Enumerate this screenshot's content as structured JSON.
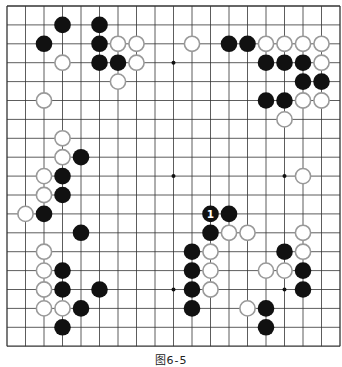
{
  "figure": {
    "caption": "图6-5",
    "board_size": 19,
    "grid": {
      "x0": 7,
      "y0": 6,
      "dx": 18.5,
      "dy": 18.9
    },
    "colors": {
      "line": "#333333",
      "black": "#111111",
      "white_fill": "#ffffff",
      "white_stroke": "#999999",
      "background": "#ffffff"
    },
    "hoshi_visible": [
      [
        9,
        3
      ],
      [
        9,
        9
      ],
      [
        15,
        9
      ],
      [
        9,
        15
      ],
      [
        15,
        15
      ]
    ],
    "black_stones": [
      [
        3,
        1
      ],
      [
        5,
        1
      ],
      [
        2,
        2
      ],
      [
        5,
        2
      ],
      [
        5,
        3
      ],
      [
        6,
        3
      ],
      [
        12,
        2
      ],
      [
        13,
        2
      ],
      [
        14,
        3
      ],
      [
        15,
        3
      ],
      [
        16,
        3
      ],
      [
        16,
        4
      ],
      [
        17,
        4
      ],
      [
        14,
        5
      ],
      [
        15,
        5
      ],
      [
        4,
        8
      ],
      [
        3,
        9
      ],
      [
        3,
        10
      ],
      [
        2,
        11
      ],
      [
        4,
        12
      ],
      [
        3,
        14
      ],
      [
        3,
        15
      ],
      [
        5,
        15
      ],
      [
        4,
        16
      ],
      [
        3,
        17
      ],
      [
        11,
        11
      ],
      [
        12,
        11
      ],
      [
        11,
        12
      ],
      [
        10,
        13
      ],
      [
        10,
        14
      ],
      [
        10,
        15
      ],
      [
        10,
        16
      ],
      [
        15,
        13
      ],
      [
        16,
        14
      ],
      [
        16,
        15
      ],
      [
        14,
        16
      ],
      [
        14,
        17
      ]
    ],
    "white_stones": [
      [
        6,
        2
      ],
      [
        7,
        2
      ],
      [
        3,
        3
      ],
      [
        7,
        3
      ],
      [
        6,
        4
      ],
      [
        2,
        5
      ],
      [
        10,
        2
      ],
      [
        14,
        2
      ],
      [
        15,
        2
      ],
      [
        16,
        2
      ],
      [
        17,
        2
      ],
      [
        17,
        3
      ],
      [
        16,
        5
      ],
      [
        17,
        5
      ],
      [
        15,
        6
      ],
      [
        3,
        7
      ],
      [
        3,
        8
      ],
      [
        2,
        9
      ],
      [
        2,
        10
      ],
      [
        1,
        11
      ],
      [
        2,
        13
      ],
      [
        2,
        14
      ],
      [
        2,
        15
      ],
      [
        2,
        16
      ],
      [
        3,
        16
      ],
      [
        12,
        12
      ],
      [
        13,
        12
      ],
      [
        11,
        13
      ],
      [
        11,
        14
      ],
      [
        11,
        15
      ],
      [
        16,
        12
      ],
      [
        16,
        13
      ],
      [
        14,
        14
      ],
      [
        15,
        14
      ],
      [
        13,
        16
      ],
      [
        16,
        9
      ]
    ],
    "labels": [
      {
        "col": 11,
        "row": 11,
        "text": "1",
        "on": "black"
      }
    ]
  }
}
